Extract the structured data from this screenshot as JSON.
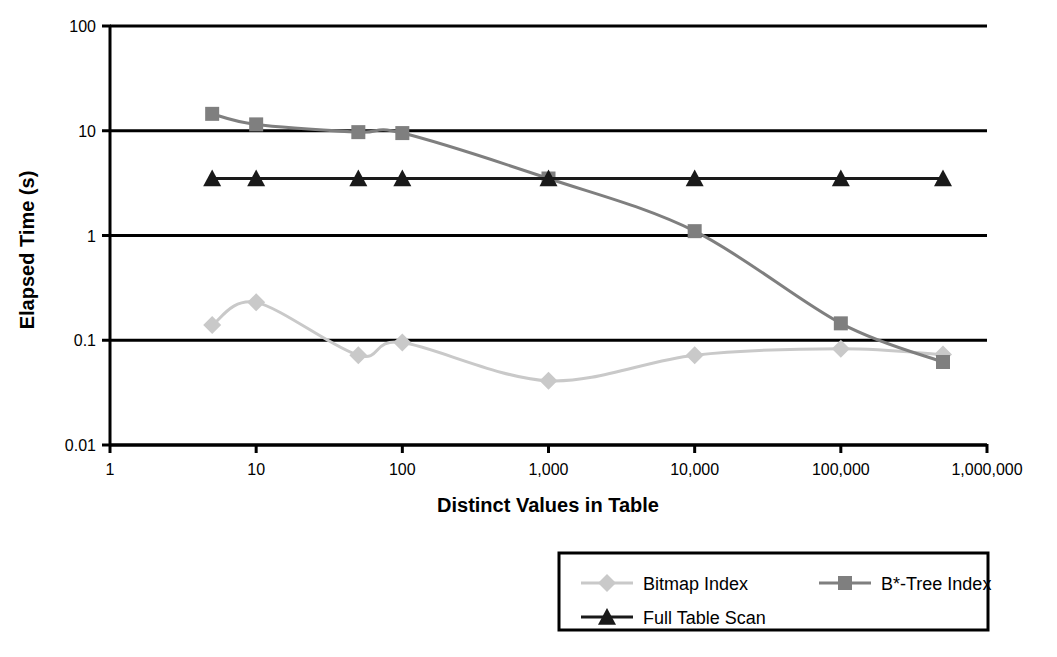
{
  "chart_data": {
    "type": "line",
    "title": "",
    "xlabel": "Distinct Values in Table",
    "ylabel": "Elapsed Time (s)",
    "xscale": "log",
    "yscale": "log",
    "xlim": [
      1,
      1000000
    ],
    "ylim": [
      0.01,
      100
    ],
    "grid": "horizontal",
    "legend_position": "bottom-center",
    "x_tick_labels": [
      "1",
      "10",
      "100",
      "1,000",
      "10,000",
      "100,000",
      "1,000,000"
    ],
    "x_tick_values": [
      1,
      10,
      100,
      1000,
      10000,
      100000,
      1000000
    ],
    "y_tick_labels": [
      "100",
      "10",
      "1",
      "0.1",
      "0.01"
    ],
    "y_tick_values": [
      100,
      10,
      1,
      0.1,
      0.01
    ],
    "x": [
      5,
      10,
      50,
      100,
      1000,
      10000,
      100000,
      500000
    ],
    "series": [
      {
        "name": "Bitmap Index",
        "marker": "diamond",
        "color": "#C9C9C9",
        "values": [
          0.14,
          0.23,
          0.072,
          0.095,
          0.041,
          0.072,
          0.083,
          0.073
        ]
      },
      {
        "name": "B*-Tree Index",
        "marker": "square",
        "color": "#7F7F7F",
        "values": [
          14.5,
          11.5,
          9.7,
          9.5,
          3.5,
          1.1,
          0.145,
          0.062
        ]
      },
      {
        "name": "Full Table Scan",
        "marker": "triangle",
        "color": "#1A1A1A",
        "values": [
          3.5,
          3.5,
          3.5,
          3.5,
          3.5,
          3.5,
          3.5,
          3.5
        ]
      }
    ]
  },
  "legend": {
    "entries": [
      {
        "label": "Bitmap Index"
      },
      {
        "label": "B*-Tree Index"
      },
      {
        "label": "Full Table Scan"
      }
    ]
  },
  "axes": {
    "x_title": "Distinct Values in Table",
    "y_title": "Elapsed Time (s)"
  }
}
